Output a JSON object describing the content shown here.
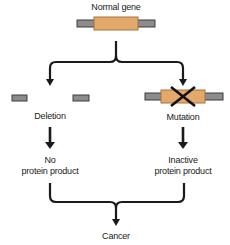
{
  "diagram": {
    "top": {
      "label": "Normal gene"
    },
    "left_branch": {
      "event_label": "Deletion",
      "outcome_line1": "No",
      "outcome_line2": "protein product"
    },
    "right_branch": {
      "event_label": "Mutation",
      "outcome_line1": "Inactive",
      "outcome_line2": "protein product"
    },
    "result": {
      "label": "Cancer"
    },
    "colors": {
      "gene_fill": "#E2A86C",
      "gene_border": "#A8733C",
      "dna_fill": "#8C8C8C",
      "dna_border": "#3C3C3C",
      "arrow": "#1A1A1A"
    }
  }
}
